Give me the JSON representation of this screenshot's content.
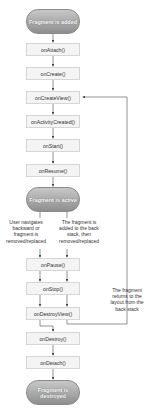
{
  "diagram": {
    "start_state": "Fragment is added",
    "active_state": "Fragment is active",
    "end_state": "Fragment is destroyed",
    "callbacks": [
      "onAttach()",
      "onCreate()",
      "onCreateView()",
      "onActivityCreated()",
      "onStart()",
      "onResume()",
      "onPause()",
      "onStop()",
      "onDestroyView()",
      "onDestroy()",
      "onDetach()"
    ],
    "notes": {
      "left_branch": "User navigates backward or fragment is removed/replaced",
      "right_branch": "The fragment is added to the back stack, then removed/replaced",
      "back_loop": "The fragment returns to the layout from the back stack"
    },
    "colors": {
      "state_pill_top": "#c8c8c8",
      "state_pill_bottom": "#8e8e8e",
      "box_fill": "#f4f4f4",
      "box_border": "#d6d6d6",
      "line": "#555555"
    }
  }
}
